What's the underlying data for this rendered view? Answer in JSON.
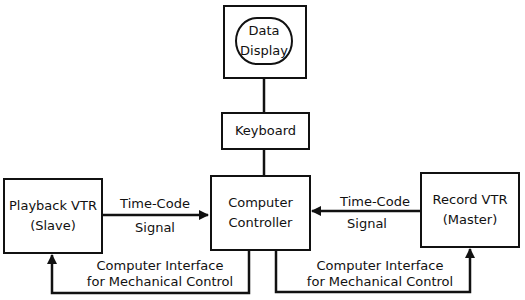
{
  "diagram": {
    "nodes": {
      "data_display": {
        "line1": "Data",
        "line2": "Display"
      },
      "keyboard": {
        "label": "Keyboard"
      },
      "computer_controller": {
        "line1": "Computer",
        "line2": "Controller"
      },
      "playback_vtr": {
        "line1": "Playback VTR",
        "line2": "(Slave)"
      },
      "record_vtr": {
        "line1": "Record VTR",
        "line2": "(Master)"
      }
    },
    "edges": {
      "left_timecode": {
        "line1": "Time-Code",
        "line2": "Signal"
      },
      "right_timecode": {
        "line1": "Time-Code",
        "line2": "Signal"
      },
      "left_interface": {
        "line1": "Computer Interface",
        "line2": "for Mechanical Control"
      },
      "right_interface": {
        "line1": "Computer Interface",
        "line2": "for Mechanical Control"
      }
    }
  }
}
